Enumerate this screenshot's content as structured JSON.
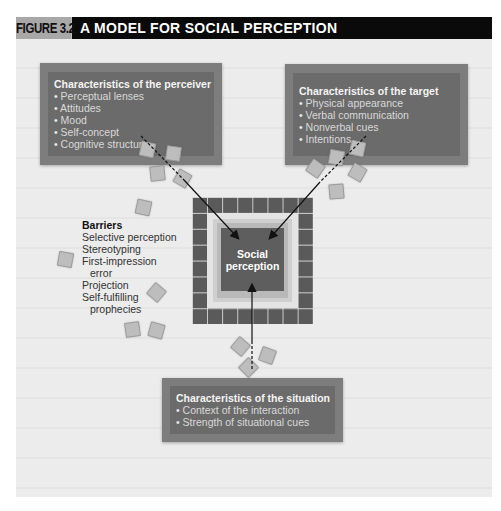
{
  "header": {
    "figure_label": "FIGURE 3.2",
    "title": "A MODEL FOR SOCIAL PERCEPTION"
  },
  "perceiver": {
    "title": "Characteristics of the perceiver",
    "items": [
      "Perceptual lenses",
      "Attitudes",
      "Mood",
      "Self-concept",
      "Cognitive structure"
    ]
  },
  "target": {
    "title": "Characteristics of the target",
    "items": [
      "Physical appearance",
      "Verbal communication",
      "Nonverbal cues",
      "Intentions"
    ]
  },
  "situation": {
    "title": "Characteristics of the situation",
    "items": [
      "Context of the interaction",
      "Strength of situational cues"
    ]
  },
  "center": {
    "line1": "Social",
    "line2": "perception"
  },
  "barriers": {
    "title": "Barriers",
    "items": [
      "Selective perception",
      "Stereotyping",
      "First-impression",
      "error",
      "Projection",
      "Self-fulfilling",
      "prophecies"
    ]
  },
  "colors": {
    "box": "#6b6b6b",
    "box_border": "#7d7d7d",
    "header_label_bg": "#a8a8a8",
    "header_title_bg": "#0a0a0a",
    "background": "#ececec"
  }
}
